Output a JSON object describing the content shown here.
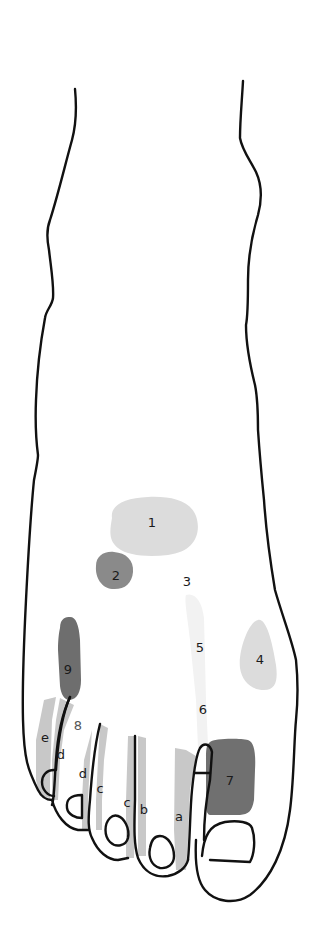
{
  "figure": {
    "colors": {
      "outline": "#111111",
      "light_zone": "#dcdcdc",
      "faint_zone": "#f1f1f1",
      "medium_zone": "#8a8a8a",
      "dark_zone": "#707070",
      "toe_strip": "#c8c8c8"
    },
    "zones": [
      {
        "id": "1",
        "label": "1",
        "shade": "light"
      },
      {
        "id": "2",
        "label": "2",
        "shade": "medium"
      },
      {
        "id": "3",
        "label": "3",
        "shade": "faint"
      },
      {
        "id": "4",
        "label": "4",
        "shade": "light"
      },
      {
        "id": "5",
        "label": "5",
        "shade": "faint"
      },
      {
        "id": "6",
        "label": "6",
        "shade": "faint"
      },
      {
        "id": "7",
        "label": "7",
        "shade": "dark"
      },
      {
        "id": "8",
        "label": "8",
        "shade": "none"
      },
      {
        "id": "9",
        "label": "9",
        "shade": "dark"
      }
    ],
    "toe_labels": [
      {
        "id": "a",
        "label": "a"
      },
      {
        "id": "b",
        "label": "b"
      },
      {
        "id": "c1",
        "label": "c"
      },
      {
        "id": "c2",
        "label": "c"
      },
      {
        "id": "d1",
        "label": "d"
      },
      {
        "id": "d2",
        "label": "d"
      },
      {
        "id": "e",
        "label": "e"
      }
    ]
  }
}
